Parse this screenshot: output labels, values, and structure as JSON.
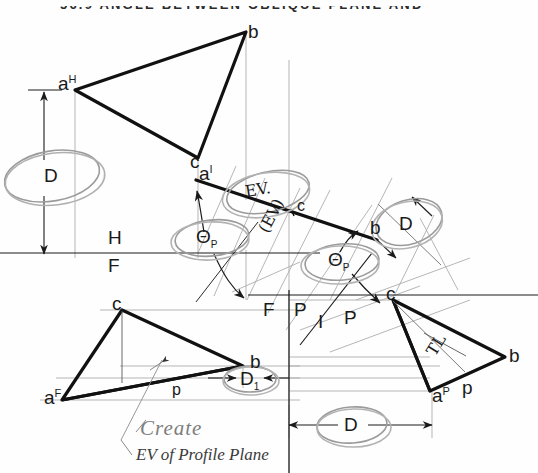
{
  "page": {
    "header": "56.9  ANGLE BETWEEN OBLIQUE PLANE AND",
    "width": 538,
    "height": 473,
    "background": "#fefefe",
    "ink": "#1a1a1a",
    "pencil_gray": "#8a8a8a",
    "construction_gray": "#9a9a9a"
  },
  "views": {
    "top_view": {
      "name": "horizontal-view-triangle",
      "vertices": {
        "a": {
          "label": "a",
          "exp": "H",
          "x": 75,
          "y": 90
        },
        "b": {
          "label": "b",
          "x": 246,
          "y": 32
        },
        "c": {
          "label": "c",
          "x": 198,
          "y": 158
        }
      }
    },
    "front_view": {
      "name": "frontal-view-triangle",
      "vertices": {
        "a": {
          "label": "a",
          "exp": "F",
          "x": 62,
          "y": 400
        },
        "b": {
          "label": "b",
          "x": 243,
          "y": 366
        },
        "c": {
          "label": "c",
          "x": 122,
          "y": 310
        }
      },
      "p_label": "p"
    },
    "profile_view": {
      "name": "profile-view-triangle",
      "vertices": {
        "a": {
          "label": "a",
          "exp": "P",
          "x": 432,
          "y": 391
        },
        "b": {
          "label": "b",
          "x": 505,
          "y": 357
        },
        "c": {
          "label": "c",
          "x": 393,
          "y": 300
        }
      },
      "p_label": "p",
      "tl_label": "TL"
    },
    "auxiliary_edge_view": {
      "name": "auxiliary-edge-view-line",
      "start": {
        "label": "a",
        "exp": "I",
        "x": 197,
        "y": 181
      },
      "end": {
        "label": "b",
        "x": 376,
        "y": 239
      },
      "mid": {
        "label": "c",
        "x": 291,
        "y": 211
      },
      "ev_label": "EV.",
      "ev_paren_label": "(EV)"
    }
  },
  "fold_lines": [
    {
      "name": "hf-fold-line",
      "upper": "H",
      "lower": "F",
      "y": 253,
      "x1": 0,
      "x2": 320
    },
    {
      "name": "fp-fold-line",
      "left": "F",
      "right": "P",
      "x": 289,
      "y_top": 295,
      "y_bot": 473
    },
    {
      "name": "ip-fold-line",
      "left": "I",
      "right": "P",
      "angle_deg": -52
    }
  ],
  "dimensions": [
    {
      "name": "depth-left-vertical",
      "label": "D",
      "x": 52,
      "y": 175,
      "orientation": "vertical"
    },
    {
      "name": "depth-right-aux",
      "label": "D",
      "x": 404,
      "y": 225,
      "orientation": "oblique"
    },
    {
      "name": "depth-one-front",
      "label": "D",
      "sub": "1",
      "x": 249,
      "y": 378,
      "orientation": "horizontal"
    },
    {
      "name": "depth-bottom-profile",
      "label": "D",
      "x": 350,
      "y": 424,
      "orientation": "horizontal"
    }
  ],
  "angles": [
    {
      "name": "theta-p-left",
      "label": "Θ",
      "sub": "P",
      "x": 206,
      "y": 236
    },
    {
      "name": "theta-p-right",
      "label": "Θ",
      "sub": "P",
      "x": 336,
      "y": 259
    }
  ],
  "annotations": {
    "create_note": "Create",
    "ev_profile_note": "EV of Profile Plane"
  }
}
